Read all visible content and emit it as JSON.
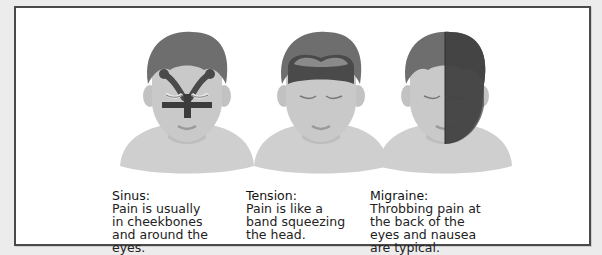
{
  "figure": {
    "panels": [
      {
        "id": "sinus",
        "title": "Sinus:",
        "description": "Pain is usually in cheekbones and around the eyes.",
        "lines": [
          "Pain is usually",
          "in cheekbones",
          "and around the",
          "eyes."
        ],
        "highlight": "sinus-cross-on-face"
      },
      {
        "id": "tension",
        "title": "Tension:",
        "description": "Pain is like a band squeezing the head.",
        "lines": [
          "Pain is like a",
          "band squeezing",
          "the head."
        ],
        "highlight": "band-around-forehead"
      },
      {
        "id": "migraine",
        "title": "Migraine:",
        "description": "Throbbing pain at the back of the eyes and nausea are typical.",
        "lines": [
          "Throbbing pain at",
          "the back of the",
          "eyes and nausea",
          "are typical."
        ],
        "highlight": "right-half-of-head-shaded"
      }
    ]
  },
  "colors": {
    "background": "#ececec",
    "frame_border": "#4a4a4a",
    "skin": "#c9c9c9",
    "shoulders": "#cfcfcf",
    "hair": "#6e6e6e",
    "pain_dark": "#3c3c3c",
    "pain_band": "#5a5a5a",
    "text": "#222222"
  }
}
